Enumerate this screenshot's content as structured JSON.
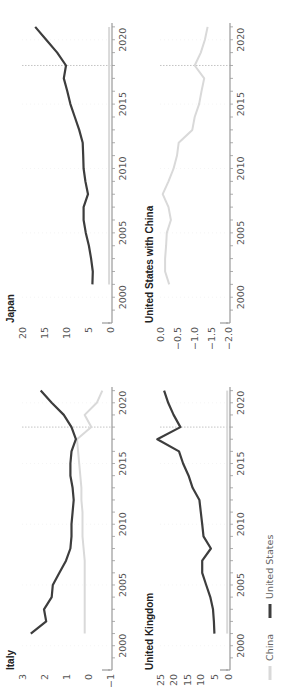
{
  "colors": {
    "us": "#3d3d3d",
    "china": "#d9d9d9",
    "axis": "#999999",
    "gridline": "#eeeeee",
    "marker_line": "#aaaaaa"
  },
  "legend": {
    "china_label": "China",
    "us_label": "United States"
  },
  "panels": {
    "italy": {
      "title": "Italy"
    },
    "uk": {
      "title": "United Kingdom"
    },
    "japan": {
      "title": "Japan"
    },
    "us_china": {
      "title": "United States with China"
    }
  },
  "chart_data": [
    {
      "type": "line",
      "title": "Italy",
      "xlabel": "",
      "ylabel": "",
      "x": [
        2001,
        2002,
        2003,
        2004,
        2005,
        2006,
        2007,
        2008,
        2009,
        2010,
        2011,
        2012,
        2013,
        2014,
        2015,
        2016,
        2017,
        2018,
        2019,
        2020,
        2021
      ],
      "xticks": [
        2000,
        2005,
        2010,
        2015,
        2020
      ],
      "yticks": [
        3,
        2,
        1,
        0,
        -1
      ],
      "ylim": [
        -1,
        3
      ],
      "vline_x": 2018,
      "series": [
        {
          "name": "United States",
          "values": [
            2.6,
            1.9,
            2.0,
            1.65,
            1.6,
            1.3,
            1.0,
            0.8,
            0.75,
            0.75,
            0.7,
            0.65,
            0.7,
            0.8,
            0.8,
            0.75,
            0.55,
            0.75,
            1.1,
            1.65,
            2.15
          ]
        },
        {
          "name": "China",
          "values": [
            0.15,
            0.15,
            0.15,
            0.15,
            0.15,
            0.15,
            0.15,
            0.2,
            0.25,
            0.25,
            0.25,
            0.3,
            0.3,
            0.35,
            0.4,
            0.45,
            0.5,
            -0.15,
            0.15,
            -0.4,
            -0.65
          ]
        }
      ]
    },
    {
      "type": "line",
      "title": "United Kingdom",
      "xlabel": "",
      "ylabel": "",
      "x": [
        2001,
        2002,
        2003,
        2004,
        2005,
        2006,
        2007,
        2008,
        2009,
        2010,
        2011,
        2012,
        2013,
        2014,
        2015,
        2016,
        2017,
        2018,
        2019,
        2020,
        2021
      ],
      "xticks": [
        2000,
        2005,
        2010,
        2015,
        2020
      ],
      "yticks": [
        25,
        20,
        15,
        10,
        5,
        0
      ],
      "ylim": [
        0,
        25
      ],
      "vline_x": 2018,
      "series": [
        {
          "name": "United States",
          "values": [
            5,
            5.2,
            5.5,
            6.5,
            8,
            9.5,
            9.5,
            6.3,
            9,
            9.5,
            10,
            10.5,
            13,
            14.5,
            16.5,
            18,
            26,
            17.5,
            20,
            22,
            23.5
          ]
        },
        {
          "name": "China",
          "values": [
            0.3,
            0.3,
            0.3,
            0.3,
            0.3,
            0.3,
            0.3,
            0.3,
            0.3,
            0.3,
            0.3,
            0.3,
            0.3,
            0.3,
            0.3,
            0.3,
            0.3,
            0.3,
            0.3,
            0.3,
            0.3
          ]
        }
      ]
    },
    {
      "type": "line",
      "title": "Japan",
      "xlabel": "",
      "ylabel": "",
      "x": [
        2001,
        2002,
        2003,
        2004,
        2005,
        2006,
        2007,
        2008,
        2009,
        2010,
        2011,
        2012,
        2013,
        2014,
        2015,
        2016,
        2017,
        2018,
        2019,
        2020,
        2021
      ],
      "xticks": [
        2000,
        2005,
        2010,
        2015,
        2020
      ],
      "yticks": [
        20,
        15,
        10,
        5,
        0
      ],
      "ylim": [
        0,
        20
      ],
      "vline_x": 2018,
      "series": [
        {
          "name": "United States",
          "values": [
            4,
            3.9,
            4.3,
            4.8,
            5.5,
            6,
            6,
            5,
            5.6,
            6,
            6.1,
            6.2,
            7,
            8,
            9,
            9.7,
            10.5,
            10,
            12,
            14.5,
            17
          ]
        },
        {
          "name": "China",
          "values": [
            0.2,
            0.2,
            0.2,
            0.2,
            0.2,
            0.2,
            0.2,
            0.2,
            0.2,
            0.2,
            0.2,
            0.2,
            0.2,
            0.2,
            0.2,
            0.2,
            0.2,
            0.2,
            0.2,
            0.2,
            0.2
          ]
        }
      ]
    },
    {
      "type": "line",
      "title": "United States with China",
      "xlabel": "",
      "ylabel": "",
      "x": [
        2001,
        2002,
        2003,
        2004,
        2005,
        2006,
        2007,
        2008,
        2009,
        2010,
        2011,
        2012,
        2013,
        2014,
        2015,
        2016,
        2017,
        2018,
        2019,
        2020,
        2021
      ],
      "xticks": [
        2000,
        2005,
        2010,
        2015,
        2020
      ],
      "yticks": [
        0,
        -0.5,
        -1.0,
        -1.5,
        -2.0
      ],
      "ylim": [
        -2.0,
        0
      ],
      "vline_x": 2018,
      "series": [
        {
          "name": "China",
          "values": [
            -0.27,
            -0.15,
            -0.15,
            -0.18,
            -0.2,
            -0.32,
            -0.25,
            -0.08,
            -0.25,
            -0.4,
            -0.5,
            -0.55,
            -0.95,
            -1.02,
            -1.15,
            -1.22,
            -1.3,
            -1.02,
            -1.2,
            -1.32,
            -1.4
          ]
        }
      ]
    }
  ]
}
